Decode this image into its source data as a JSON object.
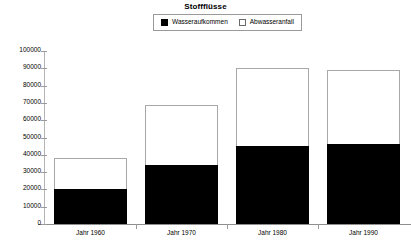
{
  "chart_data": {
    "type": "bar",
    "title": "Stoffflüsse",
    "xlabel": "",
    "ylabel": "",
    "ylim": [
      0,
      100000
    ],
    "ytick_step": 10000,
    "grid": false,
    "legend_position": "top-center",
    "categories": [
      "Jahr 1960",
      "Jahr 1970",
      "Jahr 1980",
      "Jahr 1990"
    ],
    "yticks": [
      "0",
      "10000",
      "20000",
      "30000",
      "40000",
      "50000",
      "60000",
      "70000",
      "80000",
      "90000",
      "100000"
    ],
    "series": [
      {
        "name": "Wasseraufkommen",
        "swatch": "filled",
        "color": "#000000",
        "values": [
          20000,
          34000,
          45000,
          46000
        ]
      },
      {
        "name": "Abwasseranfall",
        "swatch": "hollow",
        "color": "#ffffff",
        "values": [
          38000,
          69000,
          90000,
          89000
        ]
      }
    ]
  }
}
